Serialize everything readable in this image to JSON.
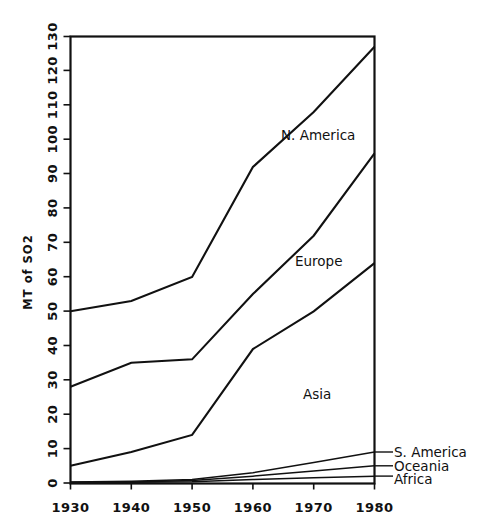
{
  "chart_data": {
    "type": "line",
    "title": "",
    "xlabel": "",
    "ylabel": "MT of SO2",
    "x": [
      1930,
      1940,
      1950,
      1960,
      1970,
      1980
    ],
    "xtick_labels": [
      "1930",
      "1940",
      "1950",
      "1960",
      "1970",
      "1980"
    ],
    "ytick_labels": [
      "0",
      "10",
      "20",
      "30",
      "40",
      "50",
      "60",
      "70",
      "80",
      "90",
      "100",
      "110",
      "120",
      "130"
    ],
    "yticks": [
      0,
      10,
      20,
      30,
      40,
      50,
      60,
      70,
      80,
      90,
      100,
      110,
      120,
      130
    ],
    "xlim": [
      1930,
      1980
    ],
    "ylim": [
      0,
      130
    ],
    "grid": false,
    "legend_position": "inline-labels",
    "series": [
      {
        "name": "N. America",
        "label_placement": "inline-on-curve",
        "values": [
          50,
          53,
          60,
          92,
          108,
          127
        ]
      },
      {
        "name": "Europe",
        "label_placement": "inline-below-curve",
        "values": [
          28,
          35,
          36,
          55,
          72,
          96
        ]
      },
      {
        "name": "Asia",
        "label_placement": "inline-below-curve",
        "values": [
          5,
          9,
          14,
          39,
          50,
          64
        ]
      },
      {
        "name": "S. America",
        "label_placement": "right-leader",
        "values": [
          0.3,
          0.5,
          1,
          3,
          6,
          9
        ]
      },
      {
        "name": "Oceania",
        "label_placement": "right-leader",
        "values": [
          0.2,
          0.3,
          0.7,
          2,
          3.5,
          5
        ]
      },
      {
        "name": "Africa",
        "label_placement": "right-leader",
        "values": [
          0.1,
          0.2,
          0.4,
          1,
          1.5,
          2
        ]
      }
    ],
    "colors": {
      "line": "#111111",
      "axis": "#111111",
      "background": "#ffffff"
    }
  }
}
